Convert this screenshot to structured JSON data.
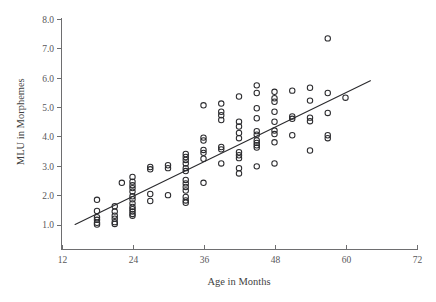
{
  "chart_data": {
    "type": "scatter",
    "title": "",
    "xlabel": "Age in Months",
    "ylabel": "MLU in Morphemes",
    "xlim": [
      12,
      72
    ],
    "ylim": [
      0.6,
      8.0
    ],
    "grid": false,
    "legend": null,
    "x_ticks": [
      12,
      24,
      36,
      48,
      60,
      72
    ],
    "x_tick_labels": [
      "12",
      "24",
      "36",
      "48",
      "60",
      "72"
    ],
    "y_ticks": [
      1.0,
      2.0,
      3.0,
      4.0,
      5.0,
      6.0,
      7.0,
      8.0
    ],
    "y_tick_labels": [
      "1.0",
      "2.0",
      "3.0",
      "4.0",
      "5.0",
      "6.0",
      "7.0",
      "8.0"
    ],
    "marker": "open-circle",
    "marker_color": "#2b2b2e",
    "fit_line": {
      "label": "regression-line",
      "x_start": 14.3,
      "y_start": 1.0,
      "x_end": 64.2,
      "y_end": 5.9,
      "color": "#2b2b2e"
    },
    "points": [
      [
        18.0,
        1.84
      ],
      [
        18.0,
        1.46
      ],
      [
        18.0,
        1.25
      ],
      [
        18.0,
        1.16
      ],
      [
        18.0,
        1.06
      ],
      [
        18.0,
        1.0
      ],
      [
        21.0,
        1.62
      ],
      [
        21.0,
        1.44
      ],
      [
        21.0,
        1.3
      ],
      [
        21.0,
        1.2
      ],
      [
        21.0,
        1.08
      ],
      [
        21.0,
        1.02
      ],
      [
        22.2,
        2.42
      ],
      [
        24.0,
        2.62
      ],
      [
        24.0,
        2.46
      ],
      [
        24.0,
        2.34
      ],
      [
        24.0,
        2.24
      ],
      [
        24.0,
        2.12
      ],
      [
        24.0,
        1.96
      ],
      [
        24.0,
        1.86
      ],
      [
        24.0,
        1.72
      ],
      [
        24.0,
        1.6
      ],
      [
        24.0,
        1.52
      ],
      [
        24.0,
        1.44
      ],
      [
        24.0,
        1.36
      ],
      [
        24.0,
        1.3
      ],
      [
        27.0,
        2.96
      ],
      [
        27.0,
        2.88
      ],
      [
        27.0,
        2.04
      ],
      [
        27.0,
        1.8
      ],
      [
        30.0,
        3.02
      ],
      [
        30.0,
        2.92
      ],
      [
        30.0,
        2.0
      ],
      [
        33.0,
        3.4
      ],
      [
        33.0,
        3.3
      ],
      [
        33.0,
        3.2
      ],
      [
        33.0,
        3.08
      ],
      [
        33.0,
        2.92
      ],
      [
        33.0,
        2.82
      ],
      [
        33.0,
        2.52
      ],
      [
        33.0,
        2.4
      ],
      [
        33.0,
        2.28
      ],
      [
        33.0,
        2.16
      ],
      [
        33.0,
        1.94
      ],
      [
        33.0,
        1.82
      ],
      [
        33.0,
        1.74
      ],
      [
        36.0,
        5.06
      ],
      [
        36.0,
        3.96
      ],
      [
        36.0,
        3.86
      ],
      [
        36.0,
        3.54
      ],
      [
        36.0,
        3.44
      ],
      [
        36.0,
        3.24
      ],
      [
        36.0,
        2.42
      ],
      [
        39.0,
        5.12
      ],
      [
        39.0,
        4.84
      ],
      [
        39.0,
        4.72
      ],
      [
        39.0,
        4.56
      ],
      [
        39.0,
        3.64
      ],
      [
        39.0,
        3.56
      ],
      [
        39.0,
        3.08
      ],
      [
        42.0,
        5.36
      ],
      [
        42.0,
        4.5
      ],
      [
        42.0,
        4.34
      ],
      [
        42.0,
        4.12
      ],
      [
        42.0,
        3.94
      ],
      [
        42.0,
        3.46
      ],
      [
        42.0,
        3.36
      ],
      [
        42.0,
        3.26
      ],
      [
        42.0,
        2.92
      ],
      [
        42.0,
        2.74
      ],
      [
        45.0,
        5.74
      ],
      [
        45.0,
        5.48
      ],
      [
        45.0,
        4.96
      ],
      [
        45.0,
        4.62
      ],
      [
        45.0,
        4.18
      ],
      [
        45.0,
        4.06
      ],
      [
        45.0,
        3.86
      ],
      [
        45.0,
        3.78
      ],
      [
        45.0,
        3.7
      ],
      [
        45.0,
        3.62
      ],
      [
        45.0,
        2.98
      ],
      [
        48.0,
        5.52
      ],
      [
        48.0,
        5.3
      ],
      [
        48.0,
        5.18
      ],
      [
        48.0,
        4.84
      ],
      [
        48.0,
        4.5
      ],
      [
        48.0,
        4.2
      ],
      [
        48.0,
        4.08
      ],
      [
        48.0,
        3.8
      ],
      [
        48.0,
        3.08
      ],
      [
        51.0,
        5.56
      ],
      [
        51.0,
        4.68
      ],
      [
        51.0,
        4.6
      ],
      [
        51.0,
        4.04
      ],
      [
        54.0,
        5.66
      ],
      [
        54.0,
        5.22
      ],
      [
        54.0,
        4.64
      ],
      [
        54.0,
        4.52
      ],
      [
        54.0,
        3.52
      ],
      [
        57.0,
        7.34
      ],
      [
        57.0,
        5.48
      ],
      [
        57.0,
        4.8
      ],
      [
        57.0,
        4.04
      ],
      [
        57.0,
        3.94
      ],
      [
        60.0,
        5.32
      ]
    ]
  }
}
